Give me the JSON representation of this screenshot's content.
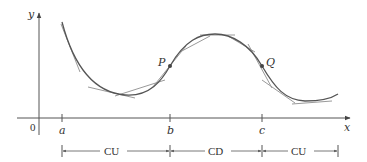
{
  "diagram": {
    "axes": {
      "y_label": "y",
      "x_label": "x",
      "origin_label": "0"
    },
    "ticks": [
      {
        "label": "a",
        "x": 62
      },
      {
        "label": "b",
        "x": 170
      },
      {
        "label": "c",
        "x": 262
      }
    ],
    "points": [
      {
        "label": "P",
        "x": 170,
        "y": 66
      },
      {
        "label": "Q",
        "x": 262,
        "y": 66
      }
    ],
    "intervals": [
      {
        "label": "CU",
        "from": "a",
        "to": "b"
      },
      {
        "label": "CD",
        "from": "b",
        "to": "c"
      },
      {
        "label": "CU",
        "from": "c",
        "to": "end"
      }
    ],
    "colors": {
      "curve": "#555555",
      "tangent": "#9a9a9a",
      "axis": "#444444"
    }
  }
}
